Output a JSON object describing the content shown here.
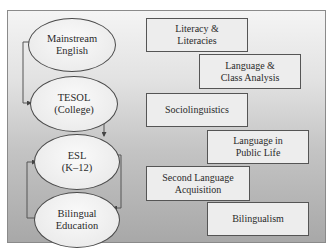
{
  "diagram": {
    "left_column": [
      {
        "id": "mainstream-english",
        "label": "Mainstream\nEnglish"
      },
      {
        "id": "tesol-college",
        "label": "TESOL\n(College)"
      },
      {
        "id": "esl-k12",
        "label": "ESL\n(K–12)"
      },
      {
        "id": "bilingual-education",
        "label": "Bilingual\nEducation"
      }
    ],
    "right_column": [
      {
        "id": "literacy",
        "label": "Literacy &\nLiteracies"
      },
      {
        "id": "language-class",
        "label": "Language &\nClass Analysis"
      },
      {
        "id": "sociolinguistics",
        "label": "Sociolinguistics"
      },
      {
        "id": "language-public-life",
        "label": "Language in\nPublic Life"
      },
      {
        "id": "sla",
        "label": "Second Language\nAcquisition"
      },
      {
        "id": "bilingualism",
        "label": "Bilingualism"
      }
    ],
    "connections": [
      {
        "from": "mainstream-english",
        "to": "tesol-college"
      },
      {
        "from": "tesol-college",
        "to": "esl-k12"
      },
      {
        "from": "esl-k12",
        "to": "bilingual-education"
      },
      {
        "from": "bilingual-education",
        "to": "esl-k12"
      }
    ],
    "colors": {
      "frame_border": "#8a8a8a",
      "shape_border": "#4a4a4a",
      "box_fill": "#ededed",
      "gradient_top": "#f4f4f4",
      "gradient_bottom": "#a8a8a8"
    }
  }
}
